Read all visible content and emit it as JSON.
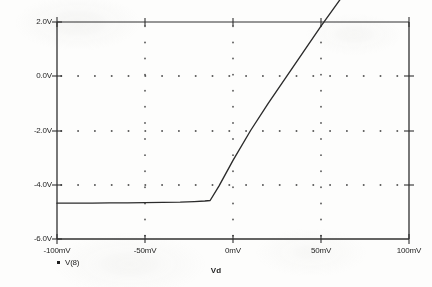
{
  "chart_data": {
    "type": "line",
    "title": "",
    "xlabel": "Vd",
    "ylabel": "",
    "xlim": [
      -100,
      100
    ],
    "ylim": [
      -6.0,
      2.0
    ],
    "x_unit": "mV",
    "y_unit": "V",
    "grid": true,
    "grid_style": "dotted",
    "legend_position": "below-left",
    "x_tick_labels": [
      "-100mV",
      "-50mV",
      "0mV",
      "50mV",
      "100mV"
    ],
    "x_tick_values": [
      -100,
      -50,
      0,
      50,
      100
    ],
    "y_tick_labels": [
      "2.0V",
      "0.0V",
      "-2.0V",
      "-4.0V",
      "-6.0V"
    ],
    "y_tick_values": [
      2.0,
      0.0,
      -2.0,
      -4.0,
      -6.0
    ],
    "series": [
      {
        "name": "V(8)",
        "color": "#2b2b2b",
        "x": [
          -100,
          -90,
          -80,
          -70,
          -60,
          -50,
          -40,
          -30,
          -22,
          -16,
          -13,
          -8,
          0,
          10,
          20,
          30,
          40,
          50,
          60,
          66,
          70,
          75,
          80,
          90,
          100
        ],
        "values": [
          -4.68,
          -4.68,
          -4.68,
          -4.67,
          -4.67,
          -4.66,
          -4.65,
          -4.64,
          -4.62,
          -4.6,
          -4.58,
          -4.05,
          -3.1,
          -2.0,
          -1.0,
          -0.05,
          0.9,
          1.85,
          2.75,
          3.3,
          3.45,
          3.5,
          3.52,
          3.53,
          3.54
        ]
      }
    ],
    "notes": {
      "left_plateau_value": -4.65,
      "right_plateau_value": 0.85,
      "knee_low_x": -13,
      "knee_high_x": 68,
      "description": "Transfer characteristic: flat low region, linear ramp through 0mV, flat high region"
    }
  },
  "legend": {
    "marker": "square-marker",
    "label": "V(8)"
  },
  "axes": {
    "x_title": "Vd",
    "y_labels": [
      "2.0V",
      "0.0V",
      "-2.0V",
      "-4.0V",
      "-6.0V"
    ],
    "x_labels": [
      "-100mV",
      "-50mV",
      "0mV",
      "50mV",
      "100mV"
    ]
  }
}
